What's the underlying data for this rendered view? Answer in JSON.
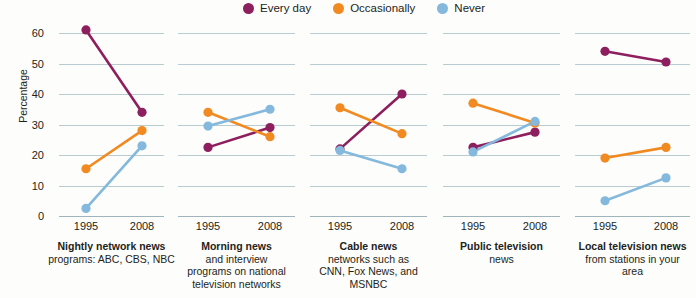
{
  "chart_data": {
    "type": "line",
    "title": "",
    "subtitle": "",
    "xlabel": "",
    "ylabel": "Percentage",
    "ylim": [
      0,
      62
    ],
    "yticks": [
      0,
      10,
      20,
      30,
      40,
      50,
      60
    ],
    "x": [
      "1995",
      "2008"
    ],
    "grid": "horizontal",
    "legend_position": "top-center",
    "legend": [
      "Every day",
      "Occasionally",
      "Never"
    ],
    "colors": {
      "every_day": "#8E1F5E",
      "occasionally": "#F18A21",
      "never": "#84B9DD",
      "gridline": "#b9ccd2",
      "background": "#fdfdfb",
      "text": "#231f20"
    },
    "panels": [
      {
        "title": "Nightly network news",
        "subtitle": "programs: ABC, CBS, NBC",
        "series": [
          {
            "name": "Every day",
            "values": [
              61,
              34
            ]
          },
          {
            "name": "Occasionally",
            "values": [
              15.5,
              28
            ]
          },
          {
            "name": "Never",
            "values": [
              2.5,
              23
            ]
          }
        ]
      },
      {
        "title": "Morning news",
        "subtitle": "and interview\nprograms on national\ntelevision networks",
        "series": [
          {
            "name": "Every day",
            "values": [
              22.5,
              29
            ]
          },
          {
            "name": "Occasionally",
            "values": [
              34,
              26
            ]
          },
          {
            "name": "Never",
            "values": [
              29.5,
              35
            ]
          }
        ]
      },
      {
        "title": "Cable news",
        "subtitle": "networks such as\nCNN, Fox News, and\nMSNBC",
        "series": [
          {
            "name": "Every day",
            "values": [
              22,
              40
            ]
          },
          {
            "name": "Occasionally",
            "values": [
              35.5,
              27
            ]
          },
          {
            "name": "Never",
            "values": [
              21.5,
              15.5
            ]
          }
        ]
      },
      {
        "title": "Public television",
        "subtitle": "news",
        "series": [
          {
            "name": "Every day",
            "values": [
              22.5,
              27.5
            ]
          },
          {
            "name": "Occasionally",
            "values": [
              37,
              30.5
            ]
          },
          {
            "name": "Never",
            "values": [
              21,
              31
            ]
          }
        ]
      },
      {
        "title": "Local television news",
        "subtitle": "from stations in your\narea",
        "series": [
          {
            "name": "Every day",
            "values": [
              54,
              50.5
            ]
          },
          {
            "name": "Occasionally",
            "values": [
              19,
              22.5
            ]
          },
          {
            "name": "Never",
            "values": [
              5,
              12.5
            ]
          }
        ]
      }
    ]
  },
  "legend": {
    "items": [
      {
        "label": "Every day",
        "color": "#8E1F5E"
      },
      {
        "label": "Occasionally",
        "color": "#F18A21"
      },
      {
        "label": "Never",
        "color": "#84B9DD"
      }
    ]
  },
  "axis": {
    "ylabel": "Percentage",
    "yticks": [
      "0",
      "10",
      "20",
      "30",
      "40",
      "50",
      "60"
    ],
    "xticks": [
      "1995",
      "2008"
    ]
  }
}
